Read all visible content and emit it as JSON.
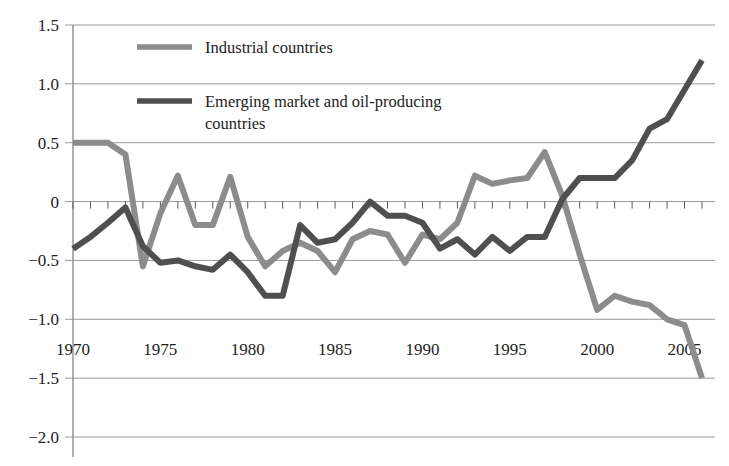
{
  "chart_data": {
    "type": "line",
    "title": "",
    "xlabel": "",
    "ylabel": "",
    "xlim": [
      1970,
      2006
    ],
    "ylim": [
      -2.0,
      1.5
    ],
    "grid": true,
    "legend_position": "top-left-inside",
    "ytick_labels": [
      "1.5",
      "1.0",
      "0.5",
      "0",
      "−0.5",
      "−1.0",
      "−1.5",
      "−2.0"
    ],
    "ytick_values": [
      1.5,
      1.0,
      0.5,
      0.0,
      -0.5,
      -1.0,
      -1.5,
      -2.0
    ],
    "xtick_labels": [
      "1970",
      "1975",
      "1980",
      "1985",
      "1990",
      "1995",
      "2000",
      "2005"
    ],
    "xtick_values": [
      1970,
      1975,
      1980,
      1985,
      1990,
      1995,
      2000,
      2005
    ],
    "x": [
      1970,
      1971,
      1972,
      1973,
      1974,
      1975,
      1976,
      1977,
      1978,
      1979,
      1980,
      1981,
      1982,
      1983,
      1984,
      1985,
      1986,
      1987,
      1988,
      1989,
      1990,
      1991,
      1992,
      1993,
      1994,
      1995,
      1996,
      1997,
      1998,
      1999,
      2000,
      2001,
      2002,
      2003,
      2004,
      2005,
      2006
    ],
    "series": [
      {
        "name": "Industrial countries",
        "color": "#8c8c8c",
        "values": [
          0.5,
          0.5,
          0.5,
          0.4,
          -0.55,
          -0.1,
          0.22,
          -0.2,
          -0.2,
          0.21,
          -0.3,
          -0.55,
          -0.42,
          -0.35,
          -0.42,
          -0.6,
          -0.32,
          -0.25,
          -0.28,
          -0.52,
          -0.28,
          -0.32,
          -0.18,
          0.22,
          0.15,
          0.18,
          0.2,
          0.42,
          0.05,
          -0.45,
          -0.92,
          -0.8,
          -0.85,
          -0.88,
          -1.0,
          -1.05,
          -1.5
        ]
      },
      {
        "name": "Emerging market and oil-producing countries",
        "color": "#4f4f4f",
        "values": [
          -0.4,
          -0.3,
          -0.18,
          -0.05,
          -0.38,
          -0.52,
          -0.5,
          -0.55,
          -0.58,
          -0.45,
          -0.6,
          -0.8,
          -0.8,
          -0.2,
          -0.35,
          -0.32,
          -0.18,
          0.0,
          -0.12,
          -0.12,
          -0.18,
          -0.4,
          -0.32,
          -0.45,
          -0.3,
          -0.42,
          -0.3,
          -0.3,
          0.02,
          0.2,
          0.2,
          0.2,
          0.35,
          0.62,
          0.7,
          0.95,
          1.2
        ]
      }
    ],
    "legend": [
      {
        "label": "Industrial countries",
        "color": "#8c8c8c"
      },
      {
        "label": "Emerging market and oil-producing",
        "color": "#4f4f4f"
      },
      {
        "label": "countries",
        "color": ""
      }
    ],
    "minor_ticks_on_zero_axis": true,
    "line_width": 6
  },
  "colors": {
    "background": "#ffffff",
    "grid": "#9a9a9a",
    "axis": "#8c8c8c",
    "text": "#1a1a1a",
    "series_light": "#8c8c8c",
    "series_dark": "#4f4f4f"
  }
}
